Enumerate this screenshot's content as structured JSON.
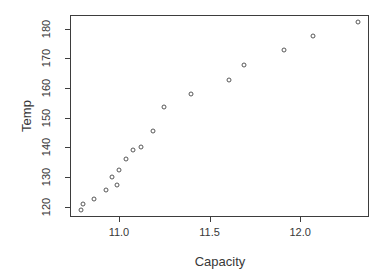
{
  "chart_data": {
    "type": "scatter",
    "title": "",
    "xlabel": "Capacity",
    "ylabel": "Temp",
    "x": [
      10.79,
      10.8,
      10.86,
      10.93,
      10.99,
      10.96,
      11.0,
      11.04,
      11.08,
      11.12,
      11.19,
      11.25,
      11.4,
      11.61,
      11.69,
      11.91,
      12.07,
      12.32
    ],
    "y": [
      118.99,
      120.76,
      122.71,
      125.48,
      127.31,
      130.06,
      132.41,
      135.89,
      139.02,
      140.25,
      145.61,
      153.45,
      158.03,
      162.72,
      167.67,
      172.86,
      177.52,
      182.09
    ],
    "n_points": 18,
    "xlim": [
      10.73,
      12.38
    ],
    "ylim": [
      116.5,
      184.6
    ],
    "x_ticks": [
      11.0,
      11.5,
      12.0
    ],
    "x_tick_labels": [
      "11.0",
      "11.5",
      "12.0"
    ],
    "y_ticks": [
      120,
      130,
      140,
      150,
      160,
      170,
      180
    ],
    "y_tick_labels": [
      "120",
      "130",
      "140",
      "150",
      "160",
      "170",
      "180"
    ],
    "grid": false,
    "legend": null,
    "marker": "open-circle",
    "colors": {
      "background": "#ffffff",
      "axis": "#3d3d3d",
      "text": "#383838",
      "marker": "#575757"
    }
  }
}
